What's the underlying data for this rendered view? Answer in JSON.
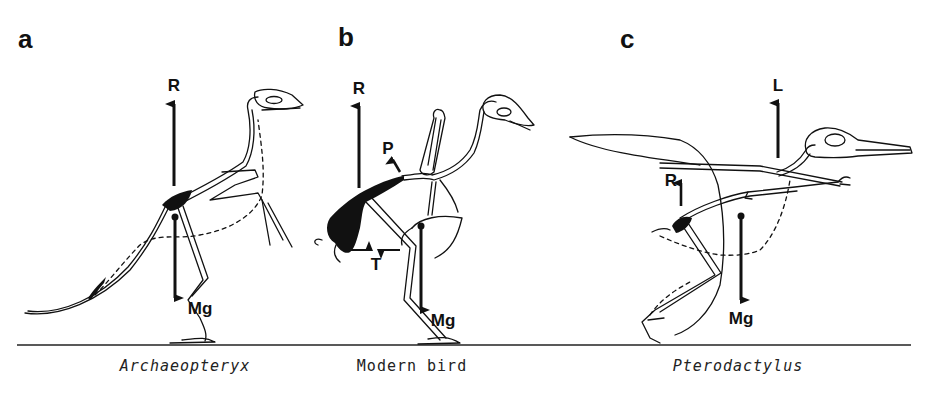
{
  "figure": {
    "panels": [
      {
        "id": "a",
        "letter": "a",
        "caption": "Archaeopteryx",
        "caption_style": "italic",
        "forces": [
          {
            "label": "R",
            "direction": "up"
          },
          {
            "label": "Mg",
            "direction": "down"
          }
        ]
      },
      {
        "id": "b",
        "letter": "b",
        "caption": "Modern bird",
        "caption_style": "normal",
        "forces": [
          {
            "label": "R",
            "direction": "up"
          },
          {
            "label": "P",
            "direction": "up-left"
          },
          {
            "label": "T",
            "direction": "opposing-horizontal"
          },
          {
            "label": "Mg",
            "direction": "down"
          }
        ]
      },
      {
        "id": "c",
        "letter": "c",
        "caption": "Pterodactylus",
        "caption_style": "italic",
        "forces": [
          {
            "label": "L",
            "direction": "up"
          },
          {
            "label": "R",
            "direction": "up"
          },
          {
            "label": "Mg",
            "direction": "down"
          }
        ]
      }
    ],
    "colors": {
      "ink": "#111111",
      "background": "#ffffff"
    }
  }
}
